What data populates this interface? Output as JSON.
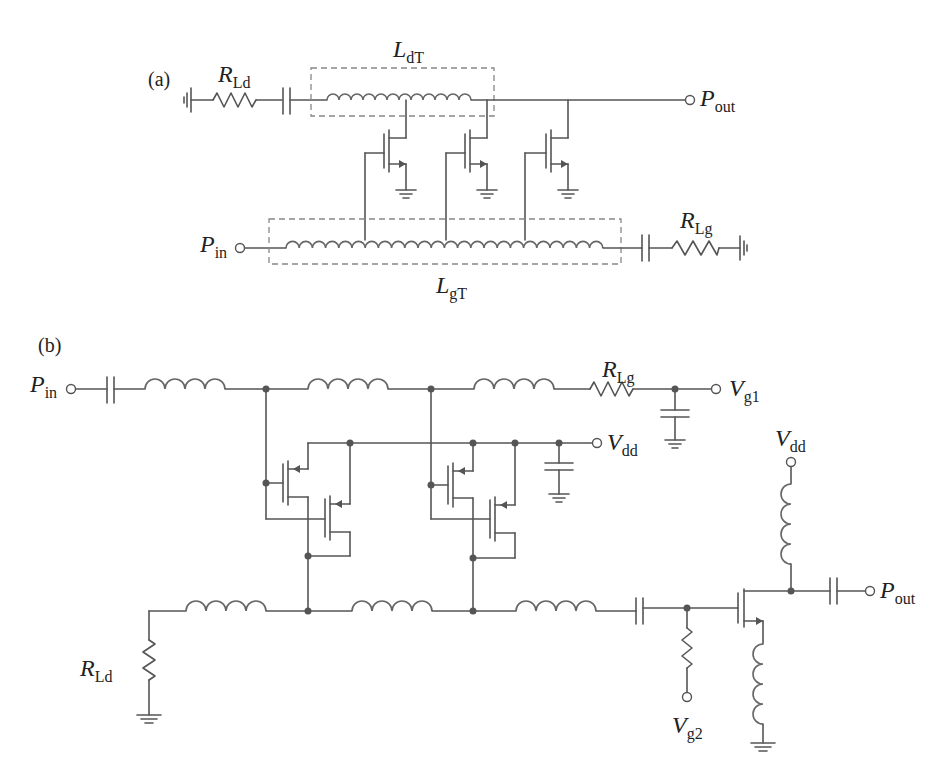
{
  "figure": {
    "panels": [
      {
        "id": "a",
        "label": "(a)",
        "description": "Distributed amplifier with artificial transmission lines",
        "components": {
          "drain_line": {
            "symbol": "L",
            "subscript": "dT",
            "type": "inductor-line"
          },
          "gate_line": {
            "symbol": "L",
            "subscript": "gT",
            "type": "inductor-line"
          },
          "drain_termination": {
            "symbol": "R",
            "subscript": "Ld",
            "type": "resistor"
          },
          "gate_termination": {
            "symbol": "R",
            "subscript": "Lg",
            "type": "resistor"
          },
          "transistor_count": 3
        },
        "ports": {
          "input": {
            "symbol": "P",
            "subscript": "in"
          },
          "output": {
            "symbol": "P",
            "subscript": "out"
          }
        }
      },
      {
        "id": "b",
        "label": "(b)",
        "description": "Cascode distributed amplifier driving output stage",
        "components": {
          "gate_termination": {
            "symbol": "R",
            "subscript": "Lg"
          },
          "drain_termination": {
            "symbol": "R",
            "subscript": "Ld"
          },
          "cascode_cells": 2
        },
        "ports": {
          "input": {
            "symbol": "P",
            "subscript": "in"
          },
          "gate_bias_1": {
            "symbol": "V",
            "subscript": "g1"
          },
          "drain_bias_1": {
            "symbol": "V",
            "subscript": "dd"
          },
          "drain_bias_2": {
            "symbol": "V",
            "subscript": "dd"
          },
          "gate_bias_2": {
            "symbol": "V",
            "subscript": "g2"
          },
          "output": {
            "symbol": "P",
            "subscript": "out"
          }
        }
      }
    ]
  },
  "colors": {
    "wire": "#555555",
    "dashed_box": "#888888",
    "text": "#222222",
    "background": "#ffffff"
  }
}
